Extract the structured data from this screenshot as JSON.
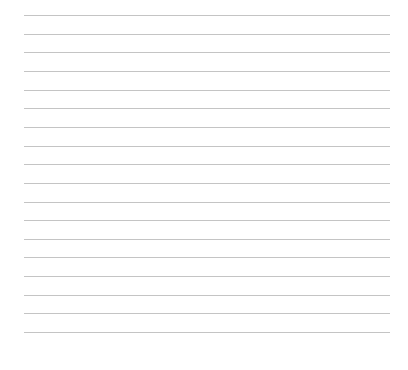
{
  "page": {
    "type": "blank-ruled-page",
    "background_color": "#ffffff",
    "line_color": "#c4c4c4",
    "line_count": 18,
    "lines": [
      {
        "y": 15
      },
      {
        "y": 34
      },
      {
        "y": 52
      },
      {
        "y": 71
      },
      {
        "y": 90
      },
      {
        "y": 108
      },
      {
        "y": 127
      },
      {
        "y": 146
      },
      {
        "y": 164
      },
      {
        "y": 183
      },
      {
        "y": 202
      },
      {
        "y": 220
      },
      {
        "y": 239
      },
      {
        "y": 257
      },
      {
        "y": 276
      },
      {
        "y": 295
      },
      {
        "y": 313
      },
      {
        "y": 332
      }
    ]
  }
}
